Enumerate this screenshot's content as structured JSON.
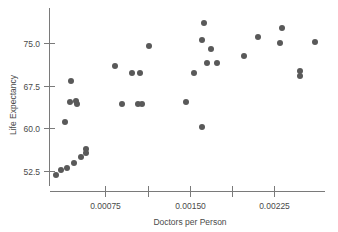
{
  "chart_data": {
    "type": "scatter",
    "title": "",
    "xlabel": "Doctors per Person",
    "ylabel": "Life Expectancy",
    "xlim": [
      0.0001,
      0.00285
    ],
    "ylim": [
      50.0,
      79.5
    ],
    "grid": false,
    "legend": false,
    "xticks": [
      0.00075,
      0.0015,
      0.00225
    ],
    "xtick_labels": [
      "0.00075",
      "0.00150",
      "0.00225"
    ],
    "xminor_ticks": [
      0.001125,
      0.001875
    ],
    "yticks": [
      52.5,
      60.0,
      67.5,
      75.0
    ],
    "ytick_labels": [
      "52.5",
      "60.0",
      "67.5",
      "75.0"
    ],
    "marker": "filled-circle",
    "marker_color": "#595959",
    "marker_size": 3.0,
    "points": [
      {
        "x": 0.00016,
        "y": 51.9
      },
      {
        "x": 0.00026,
        "y": 52.8
      },
      {
        "x": 0.00037,
        "y": 53.1
      },
      {
        "x": 0.0005,
        "y": 54.0
      },
      {
        "x": 0.00062,
        "y": 55.1
      },
      {
        "x": 0.0007,
        "y": 56.5
      },
      {
        "x": 0.0007,
        "y": 55.8
      },
      {
        "x": 0.0004,
        "y": 60.5
      },
      {
        "x": 0.00048,
        "y": 64.5
      },
      {
        "x": 0.00058,
        "y": 64.6
      },
      {
        "x": 0.0006,
        "y": 64.3
      },
      {
        "x": 0.0005,
        "y": 68.1
      },
      {
        "x": 0.00122,
        "y": 70.4
      },
      {
        "x": 0.00152,
        "y": 68.2
      },
      {
        "x": 0.00166,
        "y": 68.2
      },
      {
        "x": 0.00138,
        "y": 64.3
      },
      {
        "x": 0.00166,
        "y": 64.4
      },
      {
        "x": 0.00173,
        "y": 64.4
      },
      {
        "x": 0.00181,
        "y": 74.9
      },
      {
        "x": 0.00272,
        "y": 78.3
      },
      {
        "x": 0.00269,
        "y": 75.6
      },
      {
        "x": 0.00285,
        "y": 74.2
      },
      {
        "x": 0.00278,
        "y": 71.7
      },
      {
        "x": 0.00296,
        "y": 71.7
      },
      {
        "x": 0.00255,
        "y": 70.5
      },
      {
        "x": 0.0024,
        "y": 65.4
      },
      {
        "x": 0.00269,
        "y": 60.1
      },
      {
        "x": 0.00409,
        "y": 77.1
      },
      {
        "x": 0.00366,
        "y": 76.2
      },
      {
        "x": 0.00405,
        "y": 75.0
      },
      {
        "x": 0.00468,
        "y": 75.2
      },
      {
        "x": 0.00341,
        "y": 73.1
      },
      {
        "x": 0.00437,
        "y": 69.0
      },
      {
        "x": 0.00437,
        "y": 68.3
      }
    ],
    "pixel_points": [
      [
        56,
        175
      ],
      [
        61,
        170
      ],
      [
        67,
        168
      ],
      [
        74,
        163
      ],
      [
        81,
        157
      ],
      [
        86,
        149
      ],
      [
        86,
        153
      ],
      [
        65,
        122
      ],
      [
        70,
        102
      ],
      [
        76,
        101
      ],
      [
        77,
        104
      ],
      [
        71,
        81
      ],
      [
        115,
        66
      ],
      [
        132,
        73
      ],
      [
        140,
        73
      ],
      [
        122,
        104
      ],
      [
        138,
        104
      ],
      [
        142,
        104
      ],
      [
        149,
        46
      ],
      [
        204,
        23
      ],
      [
        202,
        40
      ],
      [
        211,
        49
      ],
      [
        207,
        63
      ],
      [
        217,
        63
      ],
      [
        194,
        73
      ],
      [
        186,
        102
      ],
      [
        202,
        127
      ],
      [
        282,
        28
      ],
      [
        258,
        37
      ],
      [
        280,
        43
      ],
      [
        315,
        42
      ],
      [
        244,
        56
      ],
      [
        300,
        71
      ],
      [
        300,
        76
      ]
    ]
  },
  "axes": {
    "x_axis_label": "Doctors per Person",
    "y_axis_label": "Life Expectancy",
    "x_tick_labels": [
      "0.00075",
      "0.00150",
      "0.00225"
    ],
    "y_tick_labels": [
      "75.0",
      "67.5",
      "60.0",
      "52.5"
    ]
  },
  "colors": {
    "marker": "#595959",
    "axis": "#7a7a7a",
    "text": "#4a4a4a",
    "background": "#ffffff"
  }
}
